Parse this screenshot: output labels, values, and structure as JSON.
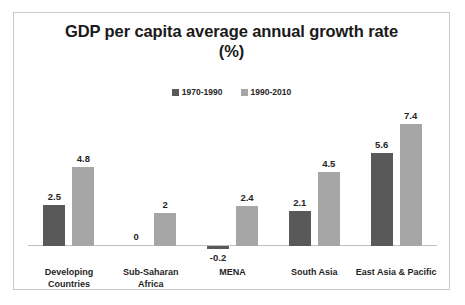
{
  "chart_data": {
    "type": "bar",
    "title": "GDP per capita average annual growth rate (%)",
    "title_lines": [
      "GDP per capita average annual growth rate",
      "(%)"
    ],
    "xlabel": "",
    "ylabel": "",
    "ylim": [
      -0.2,
      7.4
    ],
    "grid": false,
    "legend_position": "top-center",
    "categories": [
      "Developing Countries",
      "Sub-Saharan Africa",
      "MENA",
      "South Asia",
      "East Asia & Pacific"
    ],
    "category_lines": [
      [
        "Developing",
        "Countries"
      ],
      [
        "Sub-Saharan Africa"
      ],
      [
        "MENA"
      ],
      [
        "South Asia"
      ],
      [
        "East Asia & Pacific"
      ]
    ],
    "series": [
      {
        "name": "1970-1990",
        "color": "#595959",
        "values": [
          2.5,
          0,
          -0.2,
          2.1,
          5.6
        ],
        "labels": [
          "2.5",
          "0",
          "-0.2",
          "2.1",
          "5.6"
        ]
      },
      {
        "name": "1990-2010",
        "color": "#a6a6a6",
        "values": [
          4.8,
          2,
          2.4,
          4.5,
          7.4
        ],
        "labels": [
          "4.8",
          "2",
          "2.4",
          "4.5",
          "7.4"
        ]
      }
    ]
  },
  "style": {
    "frame_border_color": "#c9c9c9",
    "axis_line_color": "#c0c0c0",
    "background": "#ffffff",
    "text_color": "#262626"
  }
}
